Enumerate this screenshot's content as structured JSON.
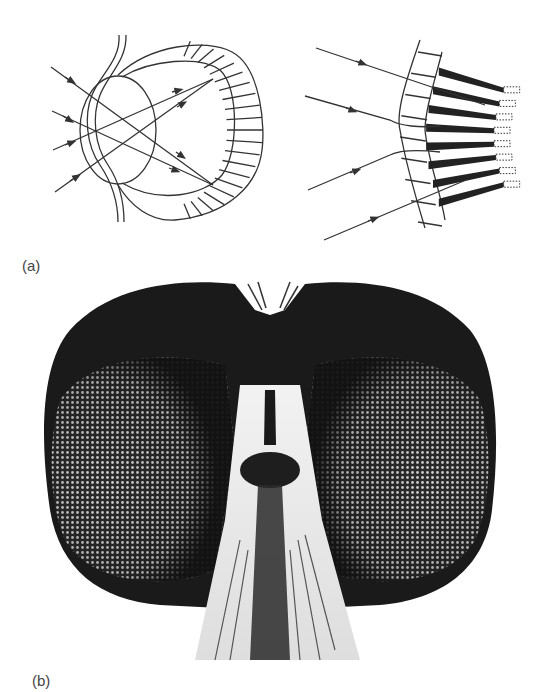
{
  "figure": {
    "panels": [
      {
        "id": "a",
        "label": "(a)",
        "subfigures": [
          {
            "name": "camera-eye-diagram",
            "description": "Single-lens (camera-type) eye with rays focused onto retina",
            "ray_count": 4
          },
          {
            "name": "compound-eye-diagram",
            "description": "Section of compound eye: lens facets with ommatidia and incoming rays",
            "ray_count": 4,
            "ommatidia_count": 8
          }
        ]
      },
      {
        "id": "b",
        "label": "(b)",
        "subfigures": [
          {
            "name": "fly-head-photo",
            "description": "Photograph of insect head showing two large compound eyes"
          }
        ]
      }
    ],
    "colors": {
      "line": "#333333",
      "background": "#ffffff",
      "label": "#444444",
      "photo_dark": "#1a1a1a"
    }
  }
}
